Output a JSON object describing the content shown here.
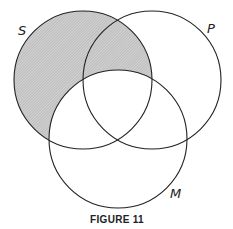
{
  "figure": {
    "caption": "FIGURE 11",
    "circles": [
      {
        "id": "S",
        "label": "S",
        "cx": 83,
        "cy": 80,
        "r": 69
      },
      {
        "id": "P",
        "label": "P",
        "cx": 152,
        "cy": 80,
        "r": 69
      },
      {
        "id": "M",
        "label": "M",
        "cx": 118,
        "cy": 139,
        "r": 69
      }
    ],
    "shaded_region": "S minus M",
    "colors": {
      "stroke": "#222222",
      "shade": "#bdbdbd",
      "background": "#ffffff"
    }
  }
}
